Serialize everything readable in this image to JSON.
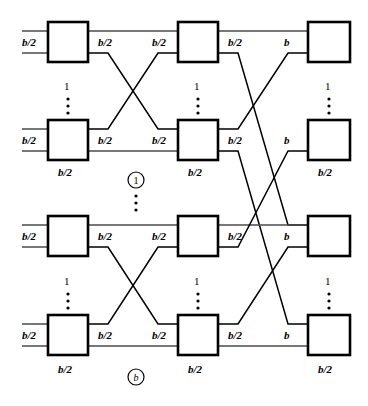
{
  "figure": {
    "type": "multistage-interconnection-network-diagram",
    "columns": 3,
    "rows_per_column": 4,
    "stage_labels": [
      "1",
      "b"
    ],
    "link_label_half": "b/2",
    "link_label_full": "b",
    "replication_label": "1",
    "vertical_ellipsis": "⋮"
  },
  "stage1": {
    "boxes": [
      {
        "id": "s1r1",
        "in_label": "b/2",
        "out_label": "b/2",
        "count_label": "1",
        "ellipsis": "⋮"
      },
      {
        "id": "s1r2",
        "in_label": "b/2",
        "out_label": "b/2",
        "bottom_label": "b/2"
      },
      {
        "id": "s1r3",
        "in_label": "b/2",
        "out_label": "b/2",
        "count_label": "1",
        "ellipsis": "⋮"
      },
      {
        "id": "s1r4",
        "in_label": "b/2",
        "out_label": "b/2",
        "bottom_label": "b/2"
      }
    ]
  },
  "stage2": {
    "boxes": [
      {
        "id": "s2r1",
        "in_label": "b/2",
        "out_label": "b/2",
        "count_label": "1",
        "ellipsis": "⋮"
      },
      {
        "id": "s2r2",
        "in_label": "b/2",
        "out_label": "b/2",
        "bottom_label": "b/2"
      },
      {
        "id": "s2r3",
        "in_label": "b/2",
        "out_label": "b/2",
        "count_label": "1",
        "ellipsis": "⋮"
      },
      {
        "id": "s2r4",
        "in_label": "b/2",
        "out_label": "b/2",
        "bottom_label": "b/2"
      }
    ]
  },
  "stage3": {
    "boxes": [
      {
        "id": "s3r1",
        "in_label": "b",
        "count_label": "1",
        "ellipsis": "⋮"
      },
      {
        "id": "s3r2",
        "in_label": "b",
        "bottom_label": "b/2"
      },
      {
        "id": "s3r3",
        "in_label": "b",
        "count_label": "1",
        "ellipsis": "⋮"
      },
      {
        "id": "s3r4",
        "in_label": "b",
        "bottom_label": "b/2"
      }
    ]
  },
  "group_markers": [
    {
      "id": "group-top",
      "label": "1",
      "italic": false,
      "ellipsis": "⋮"
    },
    {
      "id": "group-bottom",
      "label": "b",
      "italic": true
    }
  ],
  "colors": {
    "stroke": "#000000",
    "wire": "#4a4a4a",
    "background": "#ffffff"
  }
}
